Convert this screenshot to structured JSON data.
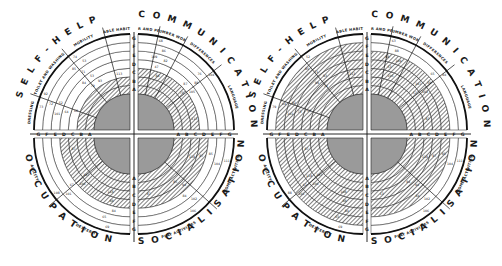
{
  "diagram": {
    "type": "developmental-progress-assessment-chart",
    "grades": [
      "A",
      "B",
      "C",
      "D",
      "E",
      "F",
      "G"
    ],
    "colors": {
      "ink": "#111111",
      "paper": "#ffffff",
      "center_fill": "#9a9a9a",
      "hatch": "#3a3a3a"
    },
    "charts": [
      {
        "id": "left",
        "center": [
          134,
          134
        ],
        "quadrants": {
          "top_left": {
            "title": "SELF-HELP",
            "subsections": [
              "TABLE HABITS",
              "MOBILITY",
              "TOILET AND WASHING",
              "DRESSING"
            ],
            "filled_rings": 2,
            "numbers": [
              "113",
              "84",
              "101",
              "85",
              "73",
              "79",
              "64",
              "71",
              "72",
              "74",
              "68",
              "53",
              "52",
              "53",
              "92",
              "93"
            ]
          },
          "top_right": {
            "title": "COMMUNICATION",
            "subsections": [
              "LANGUAGE",
              "DIFFERENCES",
              "NUMBER WORK",
              "PAPER AND PENCIL"
            ],
            "filled_rings": 3,
            "numbers": [
              "113",
              "87",
              "109",
              "76",
              "68",
              "75",
              "47",
              "88",
              "86",
              "104",
              "84",
              "105",
              "82"
            ]
          },
          "bottom_left": {
            "title": "OCCUPATION",
            "subsections": [
              "AGILITY",
              "DEXTERITY"
            ],
            "filled_rings": 4,
            "numbers": [
              "87",
              "106",
              "84",
              "101",
              "69",
              "107",
              "88",
              "67",
              "65",
              "108",
              "118"
            ]
          },
          "bottom_right": {
            "title": "SOCIALISATION",
            "subsections": [
              "PLAY ACTIVITIES",
              "HOME ACTIVITIES"
            ],
            "filled_rings": 4,
            "numbers": [
              "87",
              "94",
              "85",
              "102",
              "111",
              "85",
              "87",
              "84",
              "104",
              "106",
              "118"
            ]
          }
        }
      },
      {
        "id": "right",
        "center": [
          367,
          134
        ],
        "quadrants": {
          "top_left": {
            "title": "SELF-HELP",
            "subsections": [
              "TABLE HABITS",
              "MOBILITY",
              "TOILET AND WASHING",
              "DRESSING"
            ],
            "filled_rings": 6,
            "numbers": [
              "113",
              "99",
              "101",
              "85",
              "79",
              "74",
              "73",
              "71",
              "64",
              "52",
              "53",
              "93",
              "92"
            ]
          },
          "top_right": {
            "title": "COMMUNICATION",
            "subsections": [
              "LANGUAGE",
              "DIFFERENCES",
              "NUMBER WORK",
              "PAPER AND PENCIL"
            ],
            "filled_rings": 5,
            "numbers": [
              "87",
              "107",
              "88",
              "65",
              "63",
              "57",
              "53",
              "59",
              "88",
              "84",
              "105",
              "102",
              "104"
            ]
          },
          "bottom_left": {
            "title": "OCCUPATION",
            "subsections": [
              "AGILITY",
              "DEXTERITY"
            ],
            "filled_rings": 6,
            "numbers": [
              "87",
              "106",
              "84",
              "101",
              "69",
              "107",
              "88",
              "67",
              "65",
              "88",
              "108",
              "118"
            ]
          },
          "bottom_right": {
            "title": "SOCIALISATION",
            "subsections": [
              "PLAY ACTIVITIES",
              "HOME ACTIVITIES"
            ],
            "filled_rings": 5,
            "numbers": [
              "13",
              "94",
              "85",
              "102",
              "111",
              "84",
              "87",
              "84",
              "104",
              "106",
              "118"
            ]
          }
        }
      }
    ]
  }
}
